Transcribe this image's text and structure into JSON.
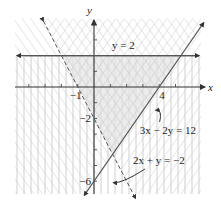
{
  "chart_data": {
    "type": "inequality-region",
    "title": "",
    "xlabel": "x",
    "ylabel": "y",
    "xlim": [
      -4.8,
      6.5
    ],
    "ylim": [
      -6.8,
      4.3
    ],
    "grid": false,
    "tick_labels": {
      "x": [
        {
          "value": -1,
          "label": "−1"
        },
        {
          "value": 4,
          "label": "4"
        }
      ],
      "y": [
        {
          "value": -2,
          "label": "−2"
        },
        {
          "value": -6,
          "label": "−6"
        }
      ]
    },
    "x_ticks": [
      -4,
      -3,
      -2,
      -1,
      1,
      2,
      3,
      4,
      5
    ],
    "y_ticks": [
      -6,
      -5,
      -4,
      -3,
      -2,
      -1,
      1,
      2,
      3
    ],
    "boundaries": [
      {
        "name": "y = 2",
        "equation": "y = 2",
        "style": "solid",
        "label": "y = 2",
        "label_pos": [
          1.8,
          2.4
        ]
      },
      {
        "name": "3x - 2y = 12",
        "equation": "3x − 2y = 12",
        "style": "solid",
        "label": "3x − 2y = 12",
        "label_pos": [
          2.8,
          -3.0
        ],
        "arrow_to": [
          3.6,
          -1.3
        ]
      },
      {
        "name": "2x + y = -2",
        "equation": "2x + y = −2",
        "style": "dashed",
        "label": "2x + y = −2",
        "label_pos": [
          2.4,
          -4.9
        ],
        "arrow_to": [
          1.0,
          -5.9
        ]
      }
    ],
    "feasible_region": {
      "vertices": [
        [
          -2,
          2
        ],
        [
          5.33,
          2
        ],
        [
          1.14,
          -4.29
        ]
      ],
      "shading": "cross-hatched, light gray"
    },
    "colors": {
      "axis": "#333333",
      "boundary": "#555555",
      "hatch": "#c8c8c8",
      "region_fill": "#e4e4e4"
    }
  }
}
